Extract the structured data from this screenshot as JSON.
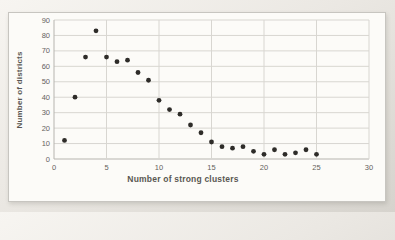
{
  "chart": {
    "style": {
      "page_background": "#e9e6e1",
      "frame_background": "#fcfbf8",
      "frame_border": "#c7c5c0",
      "grid_color": "#d8d6d1",
      "axis_color": "#b6b4af",
      "tick_label_color": "#64625d",
      "axis_title_color": "#595752",
      "marker_color": "#2e2c29"
    }
  },
  "chart_data": {
    "type": "scatter",
    "title": "",
    "xlabel": "Number of strong clusters",
    "ylabel": "Number of districts",
    "x": [
      1,
      2,
      3,
      4,
      5,
      6,
      7,
      8,
      9,
      10,
      11,
      12,
      13,
      14,
      15,
      16,
      17,
      18,
      19,
      20,
      21,
      22,
      23,
      24,
      25
    ],
    "y": [
      12,
      40,
      66,
      83,
      66,
      63,
      64,
      56,
      51,
      38,
      32,
      29,
      22,
      17,
      11,
      8,
      7,
      8,
      5,
      3,
      6,
      3,
      4,
      6,
      3
    ],
    "xlim": [
      0,
      30
    ],
    "ylim": [
      0,
      90
    ],
    "x_ticks": [
      0,
      5,
      10,
      15,
      20,
      25,
      30
    ],
    "y_ticks": [
      0,
      10,
      20,
      30,
      40,
      50,
      60,
      70,
      80,
      90
    ],
    "grid": true,
    "legend": false,
    "marker": "circle"
  }
}
